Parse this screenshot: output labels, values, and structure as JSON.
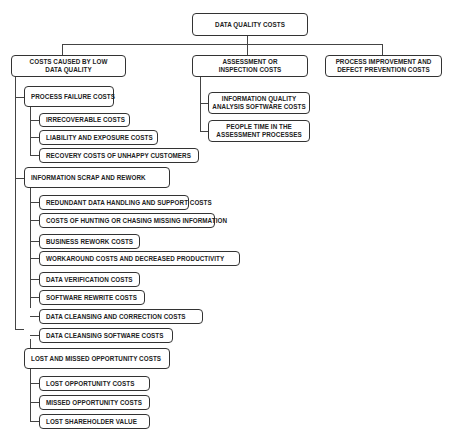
{
  "root": {
    "label": "DATA QUALITY COSTS"
  },
  "categories": [
    {
      "label_l1": "COSTS CAUSED BY LOW",
      "label_l2": "DATA QUALITY",
      "groups": [
        {
          "label": "PROCESS FAILURE COSTS",
          "items": [
            "IRRECOVERABLE COSTS",
            "LIABILITY AND EXPOSURE COSTS",
            "RECOVERY COSTS OF UNHAPPY CUSTOMERS"
          ]
        },
        {
          "label": "INFORMATION SCRAP AND REWORK",
          "items": [
            "REDUNDANT DATA HANDLING AND SUPPORT COSTS",
            "COSTS OF HUNTING OR CHASING MISSING INFORMATION",
            "BUSINESS REWORK COSTS",
            "WORKAROUND COSTS AND DECREASED PRODUCTIVITY",
            "DATA VERIFICATION COSTS",
            "SOFTWARE REWRITE COSTS",
            "DATA CLEANSING AND CORRECTION COSTS",
            "DATA CLEANSING SOFTWARE COSTS"
          ]
        },
        {
          "label": "LOST AND MISSED OPPORTUNITY COSTS",
          "items": [
            "LOST OPPORTUNITY COSTS",
            "MISSED OPPORTUNITY COSTS",
            "LOST SHAREHOLDER VALUE"
          ]
        }
      ]
    },
    {
      "label_l1": "ASSESSMENT OR",
      "label_l2": "INSPECTION COSTS",
      "items": [
        {
          "l1": "INFORMATION QUALITY",
          "l2": "ANALYSIS SOFTWARE COSTS"
        },
        {
          "l1": "PEOPLE TIME IN THE",
          "l2": "ASSESSMENT PROCESSES"
        }
      ]
    },
    {
      "label_l1": "PROCESS IMPROVEMENT AND",
      "label_l2": "DEFECT PREVENTION COSTS"
    }
  ]
}
